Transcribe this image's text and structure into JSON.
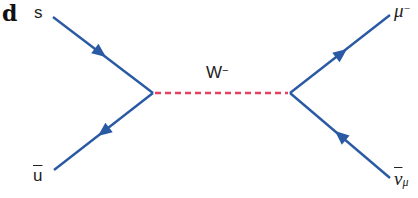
{
  "panel": {
    "label": "d"
  },
  "diagram": {
    "type": "feynman",
    "colors": {
      "fermion": "#2a5aa3",
      "boson": "#e4405f"
    },
    "vertices": [
      {
        "name": "left",
        "x": 153,
        "y": 93
      },
      {
        "name": "right",
        "x": 290,
        "y": 93
      }
    ],
    "particles": {
      "s": {
        "symbol": "s"
      },
      "anti_u": {
        "symbol": "u"
      },
      "boson": {
        "symbol": "W",
        "charge": "−"
      },
      "muon": {
        "symbol": "μ",
        "charge": "−"
      },
      "antineutrino": {
        "symbol": "ν",
        "subscript": "μ"
      }
    }
  }
}
